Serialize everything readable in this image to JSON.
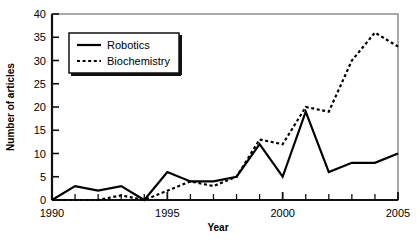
{
  "chart_data": {
    "type": "line",
    "title": "",
    "xlabel": "Year",
    "ylabel": "Number of articles",
    "xlim": [
      1990,
      2005
    ],
    "ylim": [
      0,
      40
    ],
    "xticks": [
      1990,
      1991,
      1992,
      1993,
      1994,
      1995,
      1996,
      1997,
      1998,
      1999,
      2000,
      2001,
      2002,
      2003,
      2004,
      2005
    ],
    "xtick_labels_shown": [
      "1990",
      "1995",
      "2000",
      "2005"
    ],
    "yticks": [
      0,
      5,
      10,
      15,
      20,
      25,
      30,
      35,
      40
    ],
    "ytick_labels": [
      "0",
      "5",
      "10",
      "15",
      "20",
      "25",
      "30",
      "35",
      "40"
    ],
    "grid": false,
    "legend_position": "top-left",
    "x": [
      1990,
      1991,
      1992,
      1993,
      1994,
      1995,
      1996,
      1997,
      1998,
      1999,
      2000,
      2001,
      2002,
      2003,
      2004,
      2005
    ],
    "series": [
      {
        "name": "Robotics",
        "style": "solid",
        "color": "#000000",
        "values": [
          0,
          3,
          2,
          3,
          0,
          6,
          4,
          4,
          5,
          12,
          5,
          19,
          6,
          8,
          8,
          10
        ]
      },
      {
        "name": "Biochemistry",
        "style": "dotted",
        "color": "#000000",
        "values": [
          0,
          0,
          0,
          1,
          0,
          2,
          4,
          3,
          5,
          13,
          12,
          20,
          19,
          30,
          36,
          33
        ]
      }
    ]
  },
  "legend": {
    "entries": [
      {
        "label": "Robotics",
        "swatch": "solid-line-swatch"
      },
      {
        "label": "Biochemistry",
        "swatch": "dotted-line-swatch"
      }
    ]
  },
  "axes": {
    "y_title": "Number of articles",
    "x_title": "Year",
    "y_labels": [
      "40",
      "35",
      "30",
      "25",
      "20",
      "15",
      "10",
      "5",
      "0"
    ],
    "x_labels": [
      "1990",
      "1995",
      "2000",
      "2005"
    ]
  },
  "colors": {
    "axis": "#1a1a1a",
    "series_robotics": "#000000",
    "series_biochemistry": "#000000",
    "background": "#ffffff"
  }
}
